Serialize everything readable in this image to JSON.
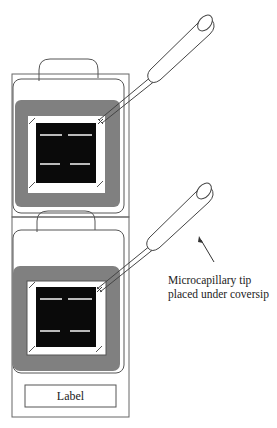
{
  "diagram": {
    "caption_line1": "Microcapillary tip",
    "caption_line2": "placed under coversip",
    "slide_label": "Label",
    "colors": {
      "frame_gray": "#808080",
      "array_black": "#0a0a0a",
      "stroke": "#555555"
    }
  }
}
